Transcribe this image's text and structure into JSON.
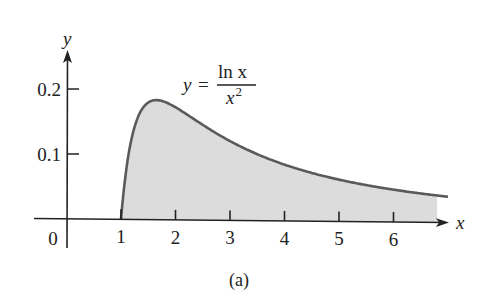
{
  "chart_data": {
    "type": "area",
    "title": "",
    "function_label": {
      "lhs": "y",
      "eq": "=",
      "numerator": "ln x",
      "denominator_base": "x",
      "denominator_exp": "2"
    },
    "xlabel": "x",
    "ylabel": "y",
    "xlim": [
      0,
      7
    ],
    "ylim": [
      0,
      0.25
    ],
    "x_ticks": [
      "1",
      "2",
      "3",
      "4",
      "5",
      "6"
    ],
    "x_origin_label": "0",
    "y_ticks": [
      "0.1",
      "0.2"
    ],
    "shaded_region": {
      "from_x": 1,
      "to_x": 6.8,
      "description": "area under y = ln x / x^2 from x = 1 to the right"
    },
    "series": [
      {
        "name": "y = ln x / x^2",
        "x": [
          1.0,
          1.1,
          1.2,
          1.3,
          1.4,
          1.5,
          1.649,
          1.8,
          2.0,
          2.5,
          3.0,
          3.5,
          4.0,
          4.5,
          5.0,
          5.5,
          6.0,
          6.5,
          7.0
        ],
        "values": [
          0.0,
          0.079,
          0.127,
          0.155,
          0.172,
          0.18,
          0.184,
          0.181,
          0.173,
          0.147,
          0.122,
          0.102,
          0.087,
          0.074,
          0.064,
          0.056,
          0.05,
          0.044,
          0.04
        ]
      }
    ],
    "grid": false,
    "legend": "none",
    "caption": "(a)",
    "colors": {
      "curve": "#5a5a5a",
      "fill": "#dcdcdc",
      "axes": "#222222"
    }
  }
}
